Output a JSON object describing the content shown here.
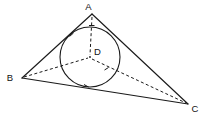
{
  "figure": {
    "type": "geometry-diagram",
    "canvas": {
      "width": 207,
      "height": 120,
      "background": "#ffffff"
    },
    "stroke_color": "#1a1a1a",
    "labels": {
      "vertex_a": "A",
      "vertex_b": "B",
      "vertex_c": "C",
      "incenter_d": "D"
    },
    "points": {
      "A": {
        "x": 92,
        "y": 14
      },
      "B": {
        "x": 22,
        "y": 78
      },
      "C": {
        "x": 188,
        "y": 104
      },
      "D": {
        "x": 90,
        "y": 57
      }
    },
    "label_positions": {
      "A": {
        "x": 88.5,
        "y": 10
      },
      "B": {
        "x": 10,
        "y": 81
      },
      "C": {
        "x": 192,
        "y": 111
      },
      "D": {
        "x": 94,
        "y": 55
      }
    },
    "incircle": {
      "cx": 90,
      "cy": 57,
      "r": 30
    },
    "solid_edges": [
      {
        "name": "edge-ab",
        "from": "A",
        "to": "B"
      },
      {
        "name": "edge-ac",
        "from": "A",
        "to": "C"
      },
      {
        "name": "edge-bc",
        "from": "B",
        "to": "C"
      }
    ],
    "dashed_segments": [
      {
        "name": "bisector-a-d",
        "x1": 92,
        "y1": 17,
        "x2": 90,
        "y2": 55
      },
      {
        "name": "bisector-b-d",
        "x1": 24,
        "y1": 77,
        "x2": 88,
        "y2": 58
      },
      {
        "name": "bisector-d-c",
        "x1": 92,
        "y1": 59,
        "x2": 186,
        "y2": 103
      }
    ],
    "tangent_ticks": [
      {
        "name": "tick-tangent-ab",
        "x1": 69.5,
        "y1": 36.5,
        "x2": 73.5,
        "y2": 33.0
      },
      {
        "name": "tick-tangent-ac",
        "x1": 104.5,
        "y1": 70.0,
        "x2": 108.5,
        "y2": 67.5
      },
      {
        "name": "tick-tangent-bc",
        "x1": 84.0,
        "y1": 84.5,
        "x2": 88.5,
        "y2": 87.0
      },
      {
        "name": "tick-apex-a",
        "x1": 89.0,
        "y1": 25.5,
        "x2": 94.5,
        "y2": 25.5
      }
    ]
  }
}
